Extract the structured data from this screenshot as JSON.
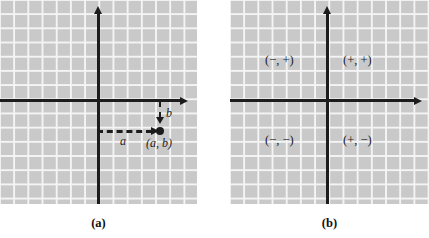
{
  "figure": {
    "panels": [
      {
        "id": "a",
        "caption": "(a)",
        "axes": {
          "x_axis": "x-axis",
          "y_axis": "y-axis"
        },
        "point": {
          "label": "(a, b)",
          "x_distance_label": "a",
          "y_distance_label": "b"
        }
      },
      {
        "id": "b",
        "caption": "(b)",
        "axes": {
          "x_axis": "x-axis",
          "y_axis": "y-axis"
        },
        "quadrant_labels": {
          "quadrant_1": "(+, +)",
          "quadrant_2": "(−, +)",
          "quadrant_3": "(−, −)",
          "quadrant_4": "(+, −)"
        }
      }
    ]
  },
  "colors": {
    "grid_background": "#c9c9c9",
    "grid_lines": "#f4f4f4",
    "ink": "#1c1c1c",
    "page": "#ffffff"
  }
}
